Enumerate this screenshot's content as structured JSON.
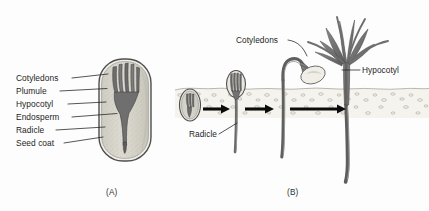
{
  "figure": {
    "background_color": "#fdfdfd",
    "ink_color": "#1d1d1d",
    "width": 429,
    "height": 211
  },
  "panel_a": {
    "caption": "(A)",
    "caption_x": 106,
    "caption_y": 195,
    "description": "Longitudinal section of a seed",
    "labels": [
      {
        "text": "Cotyledons",
        "x": 16,
        "y": 81,
        "leader": "M 72,78 L 108,74"
      },
      {
        "text": "Plumule",
        "x": 16,
        "y": 94,
        "leader": "M 60,91 L 106,88"
      },
      {
        "text": "Hypocotyl",
        "x": 16,
        "y": 107,
        "leader": "M 68,104 L 104,101"
      },
      {
        "text": "Endosperm",
        "x": 16,
        "y": 120,
        "leader": "M 72,117 L 118,113"
      },
      {
        "text": "Radicle",
        "x": 16,
        "y": 133,
        "leader": "M 56,130 L 104,127"
      },
      {
        "text": "Seed coat",
        "x": 16,
        "y": 146,
        "leader": "M 64,143 L 102,137"
      }
    ],
    "seed": {
      "center_x": 125,
      "center_y": 110,
      "width": 52,
      "height": 102,
      "coat_color": "#5a5a5a",
      "endosperm_color": "#d9d6cd",
      "embryo_color": "#6a6a6a"
    }
  },
  "panel_b": {
    "caption": "(B)",
    "caption_x": 287,
    "caption_y": 195,
    "description": "Stages of seed germination and seedling establishment",
    "labels": [
      {
        "text": "Cotyledons",
        "x": 236,
        "y": 43,
        "leader": "M 288,40 C 300,42 304,48 308,56"
      },
      {
        "text": "Hypocotyl",
        "x": 362,
        "y": 73,
        "leader": "M 360,70 L 341,70"
      },
      {
        "text": "Radicle",
        "x": 189,
        "y": 137,
        "leader": "M 218,134 L 236,124"
      }
    ],
    "soil": {
      "top_y": 88,
      "bottom_y": 118,
      "left_x": 175,
      "right_x": 429,
      "fill_color": "#f4f2ec",
      "pebble_color": "#9b968c"
    },
    "arrows": [
      {
        "x1": 202,
        "x2": 228,
        "y": 109
      },
      {
        "x1": 243,
        "x2": 272,
        "y": 109
      },
      {
        "x1": 288,
        "x2": 345,
        "y": 109
      }
    ],
    "stages": [
      {
        "name": "dormant-seed-in-soil",
        "x": 190,
        "y": 105
      },
      {
        "name": "radicle-emerging-seedling",
        "x": 235,
        "y": 100
      },
      {
        "name": "hooked-hypocotyl-seedling",
        "x": 285,
        "y": 90
      },
      {
        "name": "established-seedling",
        "x": 345,
        "y": 60
      }
    ],
    "plant_color": "#6f6f6f",
    "plant_dark": "#4a4a4a"
  }
}
